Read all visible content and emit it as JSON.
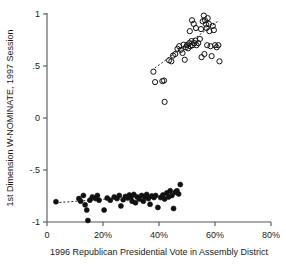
{
  "chart_data": {
    "type": "scatter",
    "title": "",
    "xlabel": "1996 Republican Presidential Vote in Assembly District",
    "ylabel": "1st Dimension W-NOMINATE, 1997 Session",
    "xlim": [
      0,
      80
    ],
    "ylim": [
      -1,
      1
    ],
    "xticks": [
      0,
      20,
      40,
      60,
      80
    ],
    "xticklabels": [
      "0",
      "20%",
      "40%",
      "60%",
      "80%"
    ],
    "yticks": [
      1,
      0.5,
      0,
      -0.5,
      -1
    ],
    "yticklabels": [
      "1",
      ".5",
      "0",
      "-.5",
      "-1"
    ],
    "grid": false,
    "legend": "none",
    "series": [
      {
        "name": "democrat-legislators",
        "marker": "filled-circle",
        "color": "#111111",
        "points": [
          [
            3.2,
            -0.805
          ],
          [
            11.4,
            -0.775
          ],
          [
            12.0,
            -0.8
          ],
          [
            13.0,
            -0.745
          ],
          [
            13.6,
            -0.835
          ],
          [
            14.2,
            -0.885
          ],
          [
            14.6,
            -0.985
          ],
          [
            15.3,
            -0.79
          ],
          [
            16.2,
            -0.76
          ],
          [
            17.4,
            -0.775
          ],
          [
            18.0,
            -0.745
          ],
          [
            18.6,
            -0.79
          ],
          [
            20.4,
            -0.885
          ],
          [
            21.5,
            -0.77
          ],
          [
            22.6,
            -0.79
          ],
          [
            24.0,
            -0.76
          ],
          [
            25.0,
            -0.775
          ],
          [
            25.8,
            -0.745
          ],
          [
            26.4,
            -0.845
          ],
          [
            27.2,
            -0.785
          ],
          [
            28.0,
            -0.755
          ],
          [
            28.8,
            -0.77
          ],
          [
            29.4,
            -0.74
          ],
          [
            30.0,
            -0.76
          ],
          [
            30.4,
            -0.8
          ],
          [
            31.0,
            -0.735
          ],
          [
            31.6,
            -0.815
          ],
          [
            32.2,
            -0.76
          ],
          [
            33.0,
            -0.78
          ],
          [
            33.8,
            -0.745
          ],
          [
            34.4,
            -0.8
          ],
          [
            35.0,
            -0.76
          ],
          [
            35.6,
            -0.735
          ],
          [
            36.2,
            -0.775
          ],
          [
            36.8,
            -0.83
          ],
          [
            37.4,
            -0.75
          ],
          [
            38.2,
            -0.765
          ],
          [
            38.8,
            -0.745
          ],
          [
            39.6,
            -0.86
          ],
          [
            40.6,
            -0.765
          ],
          [
            41.4,
            -0.74
          ],
          [
            42.0,
            -0.78
          ],
          [
            42.8,
            -0.72
          ],
          [
            43.4,
            -0.76
          ],
          [
            44.0,
            -0.7
          ],
          [
            44.6,
            -0.745
          ],
          [
            45.2,
            -0.87
          ],
          [
            45.8,
            -0.715
          ],
          [
            46.4,
            -0.7
          ],
          [
            47.0,
            -0.73
          ],
          [
            47.6,
            -0.64
          ]
        ],
        "trendline": {
          "x0": 3.0,
          "y0": -0.815,
          "x1": 21.0,
          "y1": -0.78
        }
      },
      {
        "name": "republican-legislators",
        "marker": "open-circle",
        "color": "#111111",
        "points": [
          [
            38.0,
            0.445
          ],
          [
            38.6,
            0.345
          ],
          [
            41.2,
            0.355
          ],
          [
            41.8,
            0.36
          ],
          [
            42.0,
            0.155
          ],
          [
            43.6,
            0.555
          ],
          [
            44.4,
            0.545
          ],
          [
            45.0,
            0.6
          ],
          [
            45.8,
            0.615
          ],
          [
            46.6,
            0.665
          ],
          [
            47.2,
            0.69
          ],
          [
            47.8,
            0.655
          ],
          [
            48.4,
            0.625
          ],
          [
            48.8,
            0.705
          ],
          [
            49.2,
            0.56
          ],
          [
            49.6,
            0.68
          ],
          [
            50.0,
            0.7
          ],
          [
            50.4,
            0.67
          ],
          [
            50.8,
            0.72
          ],
          [
            51.2,
            0.69
          ],
          [
            51.6,
            0.74
          ],
          [
            51.0,
            0.835
          ],
          [
            52.0,
            0.7
          ],
          [
            52.6,
            0.72
          ],
          [
            53.0,
            0.745
          ],
          [
            53.4,
            0.7
          ],
          [
            51.8,
            0.94
          ],
          [
            52.4,
            0.905
          ],
          [
            53.2,
            0.865
          ],
          [
            54.0,
            0.72
          ],
          [
            54.6,
            0.76
          ],
          [
            55.0,
            0.855
          ],
          [
            55.6,
            0.93
          ],
          [
            56.0,
            0.985
          ],
          [
            56.4,
            0.94
          ],
          [
            56.8,
            0.9
          ],
          [
            57.0,
            0.865
          ],
          [
            57.4,
            0.96
          ],
          [
            57.8,
            0.905
          ],
          [
            58.0,
            0.835
          ],
          [
            56.2,
            0.615
          ],
          [
            57.2,
            0.7
          ],
          [
            58.4,
            0.69
          ],
          [
            58.8,
            0.595
          ],
          [
            59.2,
            0.885
          ],
          [
            59.6,
            0.845
          ],
          [
            60.0,
            0.7
          ],
          [
            60.6,
            0.68
          ],
          [
            61.2,
            0.7
          ],
          [
            61.6,
            0.545
          ],
          [
            55.2,
            0.585
          ]
        ],
        "trendline": {
          "x0": 38.5,
          "y0": 0.48,
          "x1": 61.0,
          "y1": 0.93
        }
      }
    ]
  }
}
